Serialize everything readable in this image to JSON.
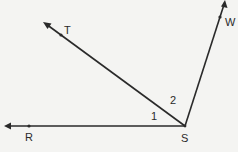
{
  "diagram": {
    "type": "angle-rays",
    "vertex": {
      "label": "S",
      "x": 185,
      "y": 126,
      "label_x": 181,
      "label_y": 142
    },
    "rays": [
      {
        "name": "SR",
        "point_label": "R",
        "point": {
          "x": 29,
          "y": 126
        },
        "tip": {
          "x": 5,
          "y": 126
        },
        "label_x": 25,
        "label_y": 141
      },
      {
        "name": "ST",
        "point_label": "T",
        "point": {
          "x": 61,
          "y": 35
        },
        "tip": {
          "x": 44,
          "y": 23
        },
        "label_x": 64,
        "label_y": 34
      },
      {
        "name": "SW",
        "point_label": "W",
        "point": {
          "x": 220,
          "y": 17
        },
        "tip": {
          "x": 225,
          "y": 1
        },
        "label_x": 225,
        "label_y": 26
      }
    ],
    "angle_labels": [
      {
        "text": "1",
        "x": 151,
        "y": 120
      },
      {
        "text": "2",
        "x": 170,
        "y": 104
      }
    ],
    "colors": {
      "line": "#2a2a2a",
      "background": "#f4f4f2"
    }
  }
}
